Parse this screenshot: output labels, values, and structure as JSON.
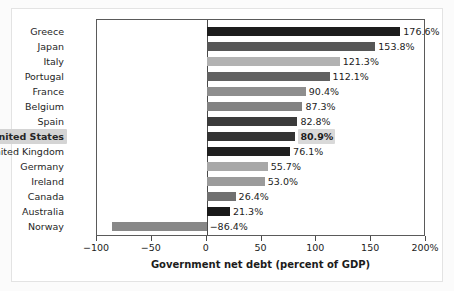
{
  "chart_data": {
    "type": "bar",
    "orientation": "horizontal",
    "title": "",
    "xlabel": "Government net debt (percent of GDP)",
    "ylabel": "",
    "xlim": [
      -100,
      200
    ],
    "grid": false,
    "legend": false,
    "categories": [
      "Greece",
      "Japan",
      "Italy",
      "Portugal",
      "France",
      "Belgium",
      "Spain",
      "United States",
      "United Kingdom",
      "Germany",
      "Ireland",
      "Canada",
      "Australia",
      "Norway"
    ],
    "values": [
      176.6,
      153.8,
      121.3,
      112.1,
      90.4,
      87.3,
      82.8,
      80.9,
      76.1,
      55.7,
      53.0,
      26.4,
      21.3,
      -86.4
    ],
    "value_labels": [
      "176.6%",
      "153.8%",
      "121.3%",
      "112.1%",
      "90.4%",
      "87.3%",
      "82.8%",
      "80.9%",
      "76.1%",
      "55.7%",
      "53.0%",
      "26.4%",
      "21.3%",
      "−86.4%"
    ],
    "bar_colors": [
      "#1d1d1d",
      "#565656",
      "#b2b2b2",
      "#616161",
      "#8e8e8e",
      "#828282",
      "#3b3b3b",
      "#333333",
      "#1f1f1f",
      "#a8a8a8",
      "#9b9b9b",
      "#707070",
      "#191919",
      "#888888"
    ],
    "highlight_category": "United States",
    "xticks": [
      -100,
      -50,
      0,
      50,
      100,
      150,
      200
    ],
    "xtick_labels": [
      "−100",
      "−50",
      "0",
      "50",
      "100",
      "150",
      "200%"
    ]
  },
  "colors": {
    "axis": "#4a4a4a",
    "text": "#1c1c1c",
    "highlight_background": "#d4d4d4",
    "plot_background": "#ffffff",
    "card_background": "#ffffff",
    "page_background": "#fbfbfb"
  }
}
